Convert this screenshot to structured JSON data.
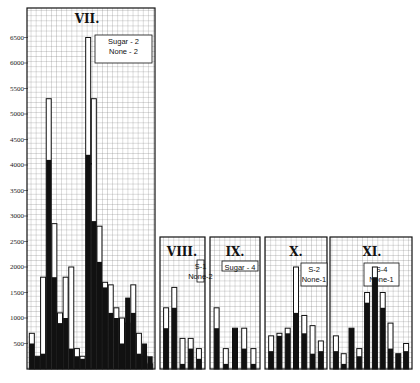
{
  "chart_data": {
    "type": "bar",
    "title": "",
    "xlabel": "",
    "ylabel": "",
    "ylim": [
      0,
      7000
    ],
    "y_ticks": [
      500,
      1000,
      1500,
      2000,
      2500,
      3000,
      3500,
      4000,
      4500,
      5000,
      5500,
      6000,
      6500
    ],
    "grid": true,
    "encoding": "Each bar: outlined (white) total height with black filled lower portion",
    "panels": [
      {
        "name": "VII.",
        "legend": [
          "Sugar - 2",
          "None - 2"
        ],
        "totals": [
          700,
          250,
          1800,
          5300,
          2850,
          1100,
          1800,
          2000,
          400,
          250,
          6500,
          5300,
          2800,
          1700,
          1650,
          1200,
          1000,
          900,
          1650,
          700,
          250,
          100
        ],
        "filled": [
          500,
          250,
          300,
          4100,
          1800,
          900,
          1000,
          400,
          250,
          200,
          4200,
          2900,
          2100,
          1600,
          1100,
          1000,
          500,
          1400,
          1100,
          300,
          500,
          250
        ]
      },
      {
        "name": "VIII.",
        "legend": [
          "S-1",
          "None-2"
        ],
        "totals": [
          1200,
          1600,
          600,
          600,
          400
        ],
        "filled": [
          800,
          1200,
          100,
          400,
          200
        ]
      },
      {
        "name": "IX.",
        "legend": [
          "Sugar - 4"
        ],
        "totals": [
          1200,
          400,
          800,
          800,
          400
        ],
        "filled": [
          800,
          100,
          800,
          400,
          100
        ]
      },
      {
        "name": "X.",
        "legend": [
          "S-2",
          "None-1"
        ],
        "totals": [
          650,
          700,
          800,
          2000,
          1050,
          850,
          550
        ],
        "filled": [
          350,
          650,
          700,
          1100,
          700,
          300,
          350
        ]
      },
      {
        "name": "XI.",
        "legend": [
          "S-4",
          "None-1"
        ],
        "totals": [
          650,
          300,
          800,
          400,
          1500,
          2000,
          1500,
          900,
          300,
          500
        ],
        "filled": [
          350,
          100,
          800,
          250,
          1300,
          1800,
          1200,
          400,
          300,
          350
        ]
      }
    ]
  }
}
